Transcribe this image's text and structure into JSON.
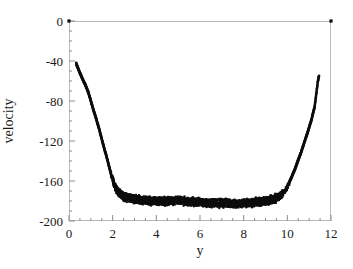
{
  "chart_data": {
    "type": "scatter",
    "title": "",
    "xlabel": "y",
    "ylabel": "velocity",
    "xlim": [
      0,
      12
    ],
    "ylim": [
      -200,
      0
    ],
    "xticks": [
      0,
      2,
      4,
      6,
      8,
      10,
      12
    ],
    "yticks": [
      0,
      -40,
      -80,
      -120,
      -160,
      -200
    ],
    "xtick_labels": [
      "0",
      "2",
      "4",
      "6",
      "8",
      "10",
      "12"
    ],
    "ytick_labels": [
      "0",
      "-40",
      "-80",
      "-120",
      "-160",
      "-200"
    ],
    "x_minor_step": 0.5,
    "y_minor_step": 10,
    "grid": false,
    "legend": null,
    "marker": "square",
    "marker_color": "#0d0d0d",
    "frame_color": "#b9b9b9",
    "series": [
      {
        "name": "velocity profile",
        "comment": "Dense scatter: two steep near-wall branches and a thick noisy plateau near -178",
        "x": [
          0.0,
          0.35,
          0.5,
          0.62,
          0.75,
          0.88,
          1.0,
          1.12,
          1.25,
          1.38,
          1.5,
          1.62,
          1.75,
          1.85,
          1.95,
          2.05,
          2.15,
          2.3,
          2.5,
          2.75,
          3.0,
          3.25,
          3.5,
          3.75,
          4.0,
          4.25,
          4.5,
          4.75,
          5.0,
          5.25,
          5.5,
          5.75,
          6.0,
          6.25,
          6.5,
          6.75,
          7.0,
          7.25,
          7.5,
          7.75,
          8.0,
          8.25,
          8.5,
          8.75,
          9.0,
          9.25,
          9.5,
          9.65,
          9.8,
          9.95,
          10.05,
          10.2,
          10.35,
          10.5,
          10.65,
          10.8,
          10.95,
          11.1,
          11.25,
          11.4,
          12.0
        ],
        "y": [
          0,
          -44,
          -52,
          -58,
          -64,
          -71,
          -80,
          -89,
          -98,
          -108,
          -118,
          -128,
          -138,
          -147,
          -155,
          -162,
          -168,
          -172,
          -175,
          -177,
          -178,
          -179,
          -179,
          -180,
          -180,
          -180,
          -180,
          -180,
          -179,
          -180,
          -181,
          -181,
          -181,
          -182,
          -182,
          -182,
          -182,
          -182,
          -183,
          -183,
          -182,
          -182,
          -181,
          -181,
          -180,
          -179,
          -177,
          -175,
          -172,
          -168,
          -163,
          -156,
          -148,
          -139,
          -130,
          -120,
          -110,
          -99,
          -86,
          -60,
          0
        ],
        "band_lower": -185,
        "band_upper": -170
      }
    ]
  },
  "axes": {
    "x_axis_label": "y",
    "y_axis_label": "velocity"
  }
}
